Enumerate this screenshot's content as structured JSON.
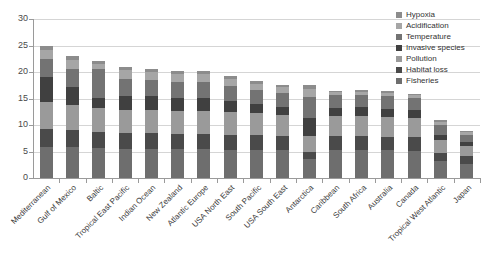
{
  "chart_data": {
    "type": "bar",
    "subtype": "stacked-bar",
    "title": "",
    "xlabel": "",
    "ylabel": "",
    "ylim": [
      0,
      30
    ],
    "ytick_step": 5,
    "yticks": [
      "0",
      "5",
      "10",
      "15",
      "20",
      "25",
      "30"
    ],
    "grid": true,
    "legend_position": "top-right",
    "categories": [
      "Mediterranean",
      "Gulf of Mexico",
      "Baltic",
      "Tropical East Pacific",
      "Indian Ocean",
      "New Zealand",
      "Atlantic Europe",
      "USA North East",
      "South Pacific",
      "USA South East",
      "Antarctica",
      "Caribbean",
      "South Africa",
      "Australia",
      "Canada",
      "Tropical West Atlantic",
      "Japan"
    ],
    "totals": [
      25.0,
      23.0,
      22.0,
      21.0,
      20.6,
      20.2,
      20.2,
      19.3,
      18.3,
      17.6,
      17.5,
      16.5,
      16.6,
      16.4,
      15.9,
      10.9,
      8.8
    ],
    "series": [
      {
        "name": "Fisheries",
        "color": "#6e6e6e",
        "values": [
          5.9,
          5.8,
          5.6,
          5.5,
          5.5,
          5.4,
          5.4,
          5.3,
          5.3,
          5.2,
          3.6,
          5.2,
          5.2,
          5.2,
          5.1,
          3.2,
          2.7
        ]
      },
      {
        "name": "Habitat loss",
        "color": "#4a4a4a",
        "values": [
          3.4,
          3.2,
          3.1,
          3.0,
          3.0,
          2.9,
          2.9,
          2.9,
          2.8,
          2.7,
          1.3,
          2.7,
          2.7,
          2.6,
          2.6,
          1.6,
          1.4
        ]
      },
      {
        "name": "Pollution",
        "color": "#9a9a9a",
        "values": [
          5.0,
          4.7,
          4.5,
          4.4,
          4.4,
          4.3,
          4.3,
          4.2,
          4.1,
          4.0,
          3.0,
          3.9,
          3.9,
          3.8,
          3.7,
          2.3,
          1.9
        ]
      },
      {
        "name": "Invasive species",
        "color": "#404040",
        "values": [
          4.7,
          3.4,
          1.9,
          2.5,
          2.6,
          2.5,
          2.5,
          2.1,
          1.8,
          1.6,
          3.4,
          1.5,
          1.6,
          1.5,
          1.5,
          1.0,
          0.8
        ]
      },
      {
        "name": "Temperature",
        "color": "#737373",
        "values": [
          3.4,
          3.4,
          5.4,
          3.2,
          3.0,
          3.0,
          3.0,
          2.9,
          2.6,
          2.5,
          4.0,
          2.3,
          2.3,
          2.3,
          2.2,
          1.9,
          1.3
        ]
      },
      {
        "name": "Acidification",
        "color": "#a6a6a6",
        "values": [
          1.8,
          1.8,
          1.0,
          1.8,
          1.5,
          1.5,
          1.5,
          1.3,
          1.2,
          1.1,
          1.5,
          0.6,
          0.6,
          0.6,
          0.5,
          0.6,
          0.5
        ]
      },
      {
        "name": "Hypoxia",
        "color": "#8c8c8c",
        "values": [
          0.8,
          0.7,
          0.5,
          0.6,
          0.6,
          0.6,
          0.6,
          0.6,
          0.5,
          0.5,
          0.7,
          0.3,
          0.3,
          0.4,
          0.3,
          0.3,
          0.2
        ]
      }
    ],
    "legend_order": [
      "Hypoxia",
      "Acidification",
      "Temperature",
      "Invasive species",
      "Pollution",
      "Habitat loss",
      "Fisheries"
    ]
  },
  "legend": {
    "items": [
      {
        "label": "Hypoxia",
        "color": "#8c8c8c"
      },
      {
        "label": "Acidification",
        "color": "#a6a6a6"
      },
      {
        "label": "Temperature",
        "color": "#737373"
      },
      {
        "label": "Invasive species",
        "color": "#404040"
      },
      {
        "label": "Pollution",
        "color": "#9a9a9a"
      },
      {
        "label": "Habitat loss",
        "color": "#4a4a4a"
      },
      {
        "label": "Fisheries",
        "color": "#6e6e6e"
      }
    ]
  },
  "axes": {
    "y_ticks": [
      "30",
      "25",
      "20",
      "15",
      "10",
      "5",
      "0"
    ]
  }
}
